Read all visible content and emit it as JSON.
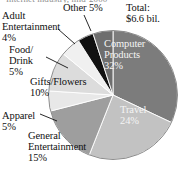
{
  "clipped_title": "Internet industry, mid-2000",
  "total_note": "Total:\n$6.6 bil.",
  "chart_data": {
    "type": "pie",
    "title": "Internet industry, mid-2000",
    "annotations": [
      "Total: $6.6 bil."
    ],
    "legend": "none",
    "labels_inside": [
      "Computer Products",
      "Travel"
    ],
    "categories": [
      "Computer Products",
      "Travel",
      "General Entertainment",
      "Apparel",
      "Gifts/Flowers",
      "Food/Drink",
      "Adult Entertainment",
      "Other"
    ],
    "values": [
      32,
      24,
      15,
      5,
      10,
      5,
      4,
      5
    ],
    "unit": "%",
    "total": "$6.6 bil.",
    "slices": [
      {
        "name": "Computer Products",
        "label": "Computer\nProducts\n32%",
        "value": 32,
        "color": "#7c7c7c",
        "start_deg": 0,
        "end_deg": 115.2,
        "label_placement": "inside"
      },
      {
        "name": "Travel",
        "label": "Travel\n24%",
        "value": 24,
        "color": "#c2c2c2",
        "start_deg": 115.2,
        "end_deg": 201.6,
        "label_placement": "inside"
      },
      {
        "name": "General Entertainment",
        "label": "General\nEntertainment\n15%",
        "value": 15,
        "color": "#9e9e9e",
        "start_deg": 201.6,
        "end_deg": 255.6,
        "label_placement": "outside"
      },
      {
        "name": "Apparel",
        "label": "Apparel\n5%",
        "value": 5,
        "color": "#e8e8e8",
        "start_deg": 255.6,
        "end_deg": 273.6,
        "label_placement": "outside-leader"
      },
      {
        "name": "Gifts/Flowers",
        "label": "Gifts/Flowers\n10%",
        "value": 10,
        "color": "#dcdcdc",
        "start_deg": 273.6,
        "end_deg": 309.6,
        "label_placement": "outside"
      },
      {
        "name": "Food/Drink",
        "label": "Food/\nDrink\n5%",
        "value": 5,
        "color": "#f0f0f0",
        "start_deg": 309.6,
        "end_deg": 327.6,
        "label_placement": "outside-leader"
      },
      {
        "name": "Adult Entertainment",
        "label": "Adult\nEntertainment\n4%",
        "value": 4,
        "color": "#111111",
        "start_deg": 327.6,
        "end_deg": 342.0,
        "label_placement": "outside-leader"
      },
      {
        "name": "Other",
        "label": "Other 5%",
        "value": 5,
        "color": "#6e6e6e",
        "start_deg": 342.0,
        "end_deg": 360.0,
        "label_placement": "outside-leader"
      }
    ]
  }
}
